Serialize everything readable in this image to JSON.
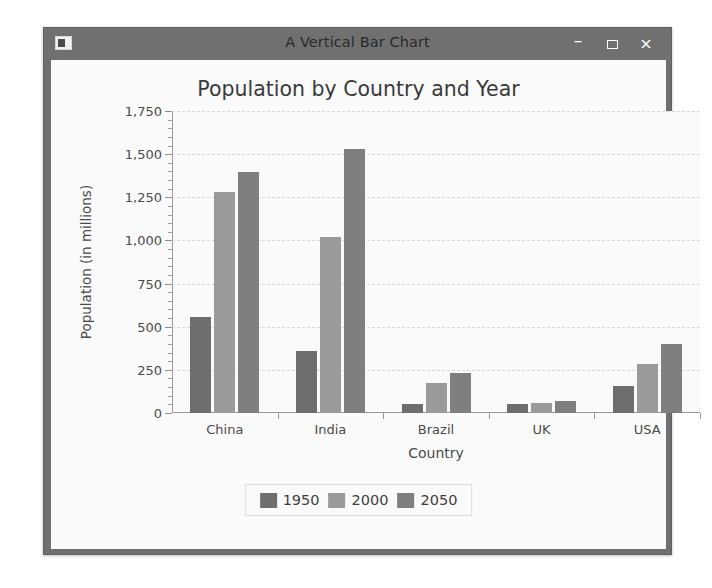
{
  "window": {
    "title": "A Vertical Bar Chart",
    "icon": "app-window-icon",
    "controls": {
      "minimize": "–",
      "maximize": "□",
      "close": "×"
    },
    "title_bar_color": "#707070",
    "border_color": "#6f6f6f",
    "client_color": "#fafafa"
  },
  "chart_data": {
    "type": "bar",
    "title": "Population by Country and Year",
    "xlabel": "Country",
    "ylabel": "Population (in millions)",
    "categories": [
      "China",
      "India",
      "Brazil",
      "UK",
      "USA"
    ],
    "series": [
      {
        "name": "1950",
        "color": "#6e6e6e",
        "values": [
          554,
          360,
          54,
          50,
          158
        ]
      },
      {
        "name": "2000",
        "color": "#9a9a9a",
        "values": [
          1280,
          1020,
          175,
          59,
          282
        ]
      },
      {
        "name": "2050",
        "color": "#7f7f7f",
        "values": [
          1395,
          1530,
          233,
          72,
          402
        ]
      }
    ],
    "ylim": [
      0,
      1750
    ],
    "ytick_values": [
      0,
      250,
      500,
      750,
      1000,
      1250,
      1500,
      1750
    ],
    "ytick_labels": [
      "0",
      "250",
      "500",
      "750",
      "1,000",
      "1,250",
      "1,500",
      "1,750"
    ],
    "minor_ticks_per_interval": 5,
    "grid": true,
    "legend_position": "bottom",
    "legend_entries": [
      {
        "label": "1950",
        "color": "#6e6e6e"
      },
      {
        "label": "2000",
        "color": "#9a9a9a"
      },
      {
        "label": "2050",
        "color": "#7f7f7f"
      }
    ]
  }
}
